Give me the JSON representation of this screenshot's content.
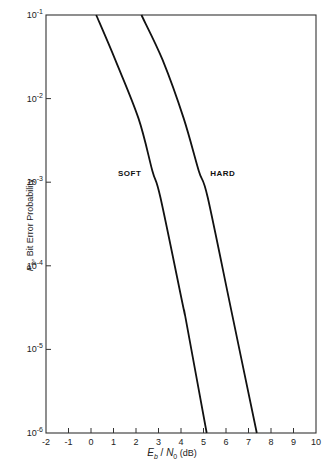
{
  "chart_data": {
    "type": "line",
    "title": "",
    "xlabel": "E_b / N_0 (dB)",
    "ylabel": "P_b , Bit Error Probability",
    "xlim": [
      -2,
      10
    ],
    "ylim": [
      1e-06,
      0.1
    ],
    "yscale": "log",
    "grid": false,
    "legend": "inline labels",
    "x_ticks": [
      "-2",
      "-1",
      "0",
      "1",
      "2",
      "3",
      "4",
      "5",
      "6",
      "7",
      "8",
      "9",
      "10"
    ],
    "y_ticks": [
      {
        "base": "10",
        "exp": "-1"
      },
      {
        "base": "10",
        "exp": "-2"
      },
      {
        "base": "10",
        "exp": "-3"
      },
      {
        "base": "10",
        "exp": "-4"
      },
      {
        "base": "10",
        "exp": "-5"
      },
      {
        "base": "10",
        "exp": "-6"
      }
    ],
    "series": [
      {
        "name": "SOFT",
        "x": [
          0.23,
          1.08,
          2.11,
          2.73,
          3.09,
          4.11,
          4.2,
          5.14
        ],
        "y": [
          0.1,
          0.029,
          0.0058,
          0.00136,
          0.00065,
          3.1e-05,
          2.4e-05,
          1e-06
        ]
      },
      {
        "name": "HARD",
        "x": [
          2.24,
          3.18,
          4.12,
          4.79,
          5.19,
          6.3,
          7.37
        ],
        "y": [
          0.1,
          0.029,
          0.0058,
          0.00136,
          0.00065,
          2.4e-05,
          1e-06
        ]
      }
    ],
    "annotations": [
      {
        "text": "SOFT",
        "x": 1.2,
        "y": 0.0012
      },
      {
        "text": "HARD",
        "x": 5.3,
        "y": 0.0012
      }
    ]
  }
}
